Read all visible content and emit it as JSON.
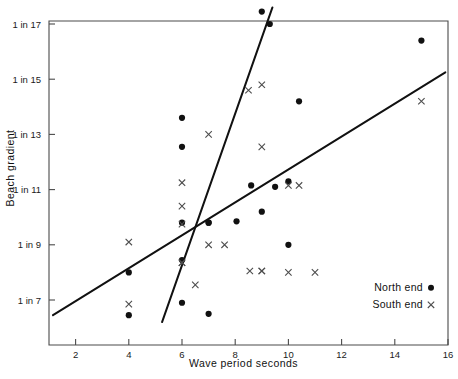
{
  "chart_data": {
    "type": "scatter",
    "title": "",
    "xlabel": "Wave period seconds",
    "ylabel": "Beach gradient",
    "xlim": [
      1,
      16
    ],
    "ylim": [
      6.1,
      17.6
    ],
    "xticks": [
      2,
      4,
      6,
      8,
      10,
      12,
      14,
      16
    ],
    "xtick_labels": [
      "2",
      "4",
      "6",
      "8",
      "10",
      "12",
      "14",
      "16"
    ],
    "yticks": [
      7,
      9,
      11,
      13,
      15,
      17
    ],
    "ytick_labels": [
      "1 in 7",
      "1 in 9",
      "1 in 11",
      "1 in 13",
      "1 in 15",
      "1 in 17"
    ],
    "grid": false,
    "legend_position": "bottom-right",
    "series": [
      {
        "name": "North end",
        "marker": "filled-circle",
        "marker_label": "●",
        "color": "#111111",
        "points": [
          [
            4.0,
            6.45
          ],
          [
            4.0,
            8.0
          ],
          [
            6.0,
            13.6
          ],
          [
            6.0,
            12.55
          ],
          [
            6.0,
            9.8
          ],
          [
            6.0,
            8.45
          ],
          [
            6.0,
            6.9
          ],
          [
            7.0,
            6.5
          ],
          [
            7.0,
            9.8
          ],
          [
            7.0,
            9.8
          ],
          [
            8.05,
            9.85
          ],
          [
            8.6,
            11.15
          ],
          [
            9.0,
            17.45
          ],
          [
            9.3,
            17.0
          ],
          [
            9.0,
            10.2
          ],
          [
            9.5,
            11.1
          ],
          [
            10.0,
            11.3
          ],
          [
            10.0,
            9.0
          ],
          [
            10.4,
            14.2
          ],
          [
            15.0,
            16.4
          ]
        ]
      },
      {
        "name": "South end",
        "marker": "cross",
        "marker_label": "×",
        "color": "#4d4d4d",
        "points": [
          [
            4.0,
            9.1
          ],
          [
            4.0,
            6.85
          ],
          [
            6.0,
            11.25
          ],
          [
            6.0,
            10.4
          ],
          [
            6.0,
            9.75
          ],
          [
            6.0,
            8.35
          ],
          [
            6.0,
            8.35
          ],
          [
            6.5,
            7.55
          ],
          [
            7.0,
            13.0
          ],
          [
            7.0,
            9.0
          ],
          [
            7.6,
            9.0
          ],
          [
            8.55,
            8.05
          ],
          [
            9.0,
            8.05
          ],
          [
            9.0,
            8.05
          ],
          [
            8.5,
            14.6
          ],
          [
            9.0,
            14.8
          ],
          [
            9.0,
            12.55
          ],
          [
            10.0,
            11.15
          ],
          [
            10.4,
            11.15
          ],
          [
            10.0,
            8.0
          ],
          [
            11.0,
            8.0
          ],
          [
            15.0,
            14.2
          ]
        ]
      }
    ],
    "trend_lines": [
      {
        "name": "south-end-trend",
        "x": [
          1.15,
          15.9
        ],
        "y": [
          6.45,
          15.25
        ]
      },
      {
        "name": "north-end-trend",
        "x": [
          5.25,
          9.4
        ],
        "y": [
          6.2,
          17.6
        ]
      }
    ]
  },
  "legend": {
    "items": [
      {
        "label": "North end",
        "marker": "●"
      },
      {
        "label": "South end",
        "marker": "×"
      }
    ]
  }
}
